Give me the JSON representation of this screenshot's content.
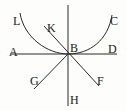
{
  "diagram": {
    "labels": {
      "L": "L",
      "K": "K",
      "C": "C",
      "A": "A",
      "B": "B",
      "D": "D",
      "G": "G",
      "F": "F",
      "H": "H"
    },
    "colors": {
      "ink": "#2a2a2a",
      "background": "#fdfdfb"
    }
  }
}
